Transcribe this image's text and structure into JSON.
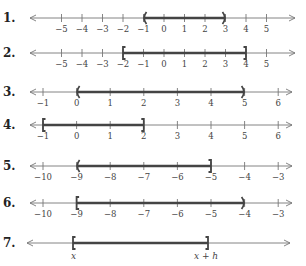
{
  "problems": [
    {
      "number": "1.",
      "y": 18,
      "ticks": [
        -5,
        -4,
        -3,
        -2,
        -1,
        0,
        1,
        2,
        3,
        4,
        5
      ],
      "origin_x": 164,
      "spacing": 20.5,
      "line_start": 30,
      "line_end": 295,
      "interval": {
        "from": -1,
        "to": 3,
        "left": "(",
        "right": ")"
      }
    },
    {
      "number": "2.",
      "y": 53,
      "ticks": [
        -5,
        -4,
        -3,
        -2,
        -1,
        0,
        1,
        2,
        3,
        4,
        5
      ],
      "origin_x": 164,
      "spacing": 20.5,
      "line_start": 30,
      "line_end": 295,
      "interval": {
        "from": -2,
        "to": 4,
        "left": "[",
        "right": "]"
      }
    },
    {
      "number": "3.",
      "y": 92,
      "ticks": [
        -1,
        0,
        1,
        2,
        3,
        4,
        5,
        6
      ],
      "origin_x": 77,
      "spacing": 33.6,
      "line_start": 30,
      "line_end": 292,
      "interval": {
        "from": 0,
        "to": 5,
        "left": "(",
        "right": ")"
      }
    },
    {
      "number": "4.",
      "y": 125,
      "ticks": [
        -1,
        0,
        1,
        2,
        3,
        4,
        5,
        6
      ],
      "origin_x": 77,
      "spacing": 33.6,
      "line_start": 30,
      "line_end": 292,
      "interval": {
        "from": -1,
        "to": 2,
        "left": "[",
        "right": "]"
      }
    },
    {
      "number": "5.",
      "y": 166,
      "ticks": [
        -10,
        -9,
        -8,
        -7,
        -6,
        -5,
        -4,
        -3
      ],
      "origin_x": 379,
      "spacing": 33.6,
      "line_start": 30,
      "line_end": 292,
      "interval": {
        "from": -9,
        "to": -5,
        "left": "(",
        "right": "]"
      }
    },
    {
      "number": "6.",
      "y": 203,
      "ticks": [
        -10,
        -9,
        -8,
        -7,
        -6,
        -5,
        -4,
        -3
      ],
      "origin_x": 379,
      "spacing": 33.6,
      "line_start": 30,
      "line_end": 292,
      "interval": {
        "from": -9,
        "to": -4,
        "left": "[",
        "right": ")"
      }
    },
    {
      "number": "7.",
      "y": 243,
      "ticks": [],
      "line_start": 27,
      "line_end": 290,
      "symbolic": {
        "left_x": 73,
        "right_x": 208,
        "left_label": "x",
        "right_label": "x + h",
        "left": "[",
        "right": "]"
      }
    }
  ],
  "colors": {
    "axis": "#777777",
    "interval": "#444444",
    "text": "#333333"
  }
}
